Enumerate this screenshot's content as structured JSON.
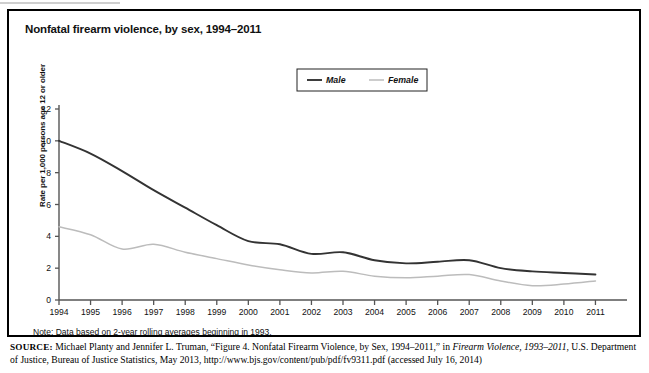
{
  "figure": {
    "title": "Nonfatal firearm violence, by sex, 1994–2011",
    "note": "Note: Data based on 2-year rolling averages beginning in 1993.",
    "source": {
      "label": "SOURCE:",
      "text_part1": " Michael Planty and Jennifer L. Truman, “Figure 4. Nonfatal Firearm Violence, by Sex, 1994–2011,” in ",
      "italic_title": "Firearm Violence, 1993–2011",
      "text_part2": ", U.S. Department of Justice, Bureau of Justice Statistics, May 2013, http://www.bjs.gov/content/pub/pdf/fv9311.pdf (accessed July 16, 2014)"
    }
  },
  "chart_data": {
    "type": "line",
    "title": "Nonfatal firearm violence, by sex, 1994–2011",
    "xlabel": "",
    "ylabel": "Rate per 1,000 persons age 12 or older",
    "xlim": [
      1994,
      2012
    ],
    "ylim": [
      0,
      12
    ],
    "yticks": [
      "0",
      "2",
      "4",
      "6",
      "8",
      "10",
      "12"
    ],
    "ytick_values": [
      0,
      2,
      4,
      6,
      8,
      10,
      12
    ],
    "grid": false,
    "legend_position": "top-center",
    "x": [
      1994,
      1995,
      1996,
      1997,
      1998,
      1999,
      2000,
      2001,
      2002,
      2003,
      2004,
      2005,
      2006,
      2007,
      2008,
      2009,
      2010,
      2011
    ],
    "categories": [
      "1994",
      "1995",
      "1996",
      "1997",
      "1998",
      "1999",
      "2000",
      "2001",
      "2002",
      "2003",
      "2004",
      "2005",
      "2006",
      "2007",
      "2008",
      "2009",
      "2010",
      "2011"
    ],
    "series": [
      {
        "name": "Male",
        "color": "#333333",
        "values": [
          10.0,
          9.2,
          8.1,
          6.9,
          5.8,
          4.7,
          3.7,
          3.5,
          2.9,
          3.0,
          2.5,
          2.3,
          2.4,
          2.5,
          2.0,
          1.8,
          1.7,
          1.6
        ]
      },
      {
        "name": "Female",
        "color": "#bcbcbc",
        "values": [
          4.6,
          4.1,
          3.2,
          3.5,
          3.0,
          2.6,
          2.2,
          1.9,
          1.7,
          1.8,
          1.5,
          1.4,
          1.5,
          1.6,
          1.2,
          0.9,
          1.0,
          1.2
        ]
      }
    ]
  },
  "legend": {
    "items": [
      {
        "label": "Male",
        "color": "#333333"
      },
      {
        "label": "Female",
        "color": "#bcbcbc"
      }
    ]
  },
  "axis": {
    "y_axis_label": "Rate per 1,000 persons age 12 or older"
  },
  "colors": {
    "male_line": "#333333",
    "female_line": "#bcbcbc",
    "axis": "#555555",
    "frame": "#000000"
  }
}
